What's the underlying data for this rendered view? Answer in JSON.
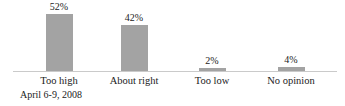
{
  "chart_data": {
    "type": "bar",
    "title": "",
    "xlabel": "",
    "ylabel": "",
    "categories": [
      "Too high",
      "About right",
      "Too low",
      "No opinion"
    ],
    "values": [
      52,
      42,
      2,
      4
    ],
    "value_labels": [
      "52%",
      "42%",
      "2%",
      "4%"
    ],
    "footnote": "April 6-9, 2008",
    "ylim": [
      0,
      60
    ],
    "grid": false,
    "legend": false,
    "bar_color": "#a3a3a3",
    "axis_line_color": "#cacaca",
    "text_color": "#222222"
  }
}
